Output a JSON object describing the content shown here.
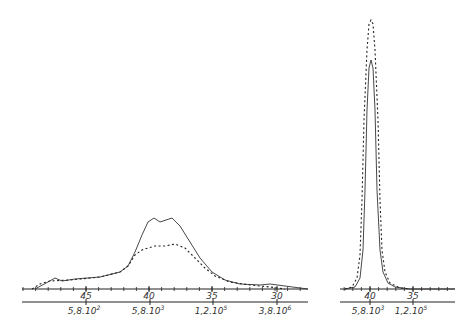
{
  "chart_data": [
    {
      "type": "line",
      "panel": "left",
      "title": "",
      "xlabel": "",
      "ylabel": "",
      "grid": false,
      "legend": "none",
      "axis_top": {
        "ticks": [
          "45",
          "40",
          "35",
          "30"
        ],
        "positions_px": [
          86,
          149,
          212,
          277
        ]
      },
      "axis_bottom": {
        "ticks": [
          "5,8.10",
          "5,8.10",
          "1,2.10",
          "3,8.10"
        ],
        "exponents": [
          "2",
          "3",
          "5",
          "6"
        ],
        "positions_px": [
          86,
          150,
          213,
          277
        ]
      },
      "series": [
        {
          "name": "solid",
          "style": "solid",
          "x": [
            50,
            40,
            45,
            40,
            35,
            30,
            28
          ],
          "points_px": [
            [
              35,
              289
            ],
            [
              48,
              282
            ],
            [
              55,
              278
            ],
            [
              62,
              281
            ],
            [
              75,
              279
            ],
            [
              100,
              277
            ],
            [
              120,
              272
            ],
            [
              128,
              266
            ],
            [
              135,
              252
            ],
            [
              142,
              235
            ],
            [
              148,
              222
            ],
            [
              154,
              218
            ],
            [
              160,
              222
            ],
            [
              166,
              220
            ],
            [
              172,
              218
            ],
            [
              180,
              226
            ],
            [
              190,
              242
            ],
            [
              200,
              258
            ],
            [
              212,
              272
            ],
            [
              225,
              280
            ],
            [
              240,
              284
            ],
            [
              260,
              285
            ],
            [
              270,
              284
            ],
            [
              285,
              286
            ],
            [
              300,
              288
            ],
            [
              308,
              289
            ]
          ]
        },
        {
          "name": "dashed",
          "style": "dashed",
          "points_px": [
            [
              32,
              289
            ],
            [
              40,
              284
            ],
            [
              50,
              281
            ],
            [
              70,
              280
            ],
            [
              100,
              277
            ],
            [
              120,
              272
            ],
            [
              128,
              266
            ],
            [
              135,
              255
            ],
            [
              142,
              250
            ],
            [
              148,
              248
            ],
            [
              155,
              246
            ],
            [
              165,
              246
            ],
            [
              175,
              244
            ],
            [
              185,
              248
            ],
            [
              195,
              258
            ],
            [
              205,
              268
            ],
            [
              215,
              276
            ],
            [
              230,
              282
            ],
            [
              250,
              285
            ],
            [
              270,
              287
            ],
            [
              285,
              289
            ]
          ]
        }
      ]
    },
    {
      "type": "line",
      "panel": "right",
      "title": "",
      "xlabel": "",
      "ylabel": "",
      "grid": false,
      "legend": "none",
      "axis_top": {
        "ticks": [
          "40",
          "35"
        ],
        "positions_px": [
          370,
          413
        ]
      },
      "axis_bottom": {
        "ticks": [
          "5,8.10",
          "1,2.10"
        ],
        "exponents": [
          "3",
          "5"
        ],
        "positions_px": [
          370,
          413
        ]
      },
      "series": [
        {
          "name": "solid",
          "style": "solid",
          "points_px": [
            [
              345,
              289
            ],
            [
              355,
              287
            ],
            [
              360,
              278
            ],
            [
              363,
              250
            ],
            [
              365,
              190
            ],
            [
              367,
              110
            ],
            [
              369,
              68
            ],
            [
              371,
              60
            ],
            [
              373,
              68
            ],
            [
              375,
              110
            ],
            [
              377,
              190
            ],
            [
              380,
              250
            ],
            [
              383,
              272
            ],
            [
              388,
              283
            ],
            [
              395,
              287
            ],
            [
              410,
              289
            ],
            [
              455,
              289
            ]
          ]
        },
        {
          "name": "dashed",
          "style": "dashed",
          "points_px": [
            [
              345,
              289
            ],
            [
              352,
              287
            ],
            [
              357,
              278
            ],
            [
              360,
              255
            ],
            [
              362,
              200
            ],
            [
              364,
              120
            ],
            [
              367,
              50
            ],
            [
              369,
              24
            ],
            [
              371,
              20
            ],
            [
              373,
              24
            ],
            [
              375,
              50
            ],
            [
              378,
              120
            ],
            [
              380,
              200
            ],
            [
              382,
              250
            ],
            [
              385,
              272
            ],
            [
              390,
              283
            ],
            [
              400,
              288
            ],
            [
              410,
              289
            ]
          ]
        }
      ]
    }
  ]
}
